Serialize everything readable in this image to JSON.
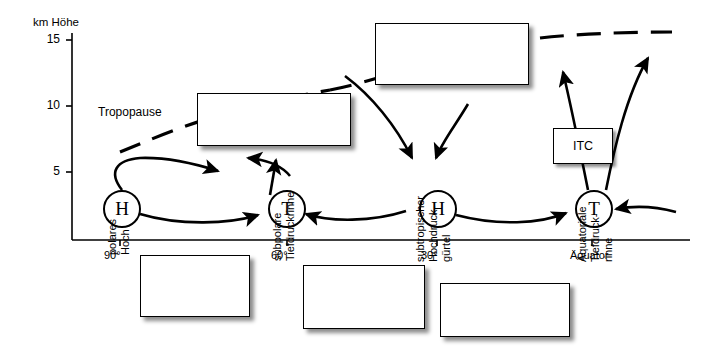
{
  "axis": {
    "y_title": "km Höhe",
    "y_ticks": [
      "15",
      "10",
      "5"
    ],
    "x_ticks": [
      "90°",
      "60°",
      "30°",
      "Äquator"
    ]
  },
  "labels": {
    "tropopause": "Tropopause",
    "itc": "ITC"
  },
  "ground_labels": [
    {
      "line1": "polares",
      "line2": "Hoch"
    },
    {
      "line1": "subpolare",
      "line2": "Tiefdruckrinne"
    },
    {
      "line1": "subtropischer",
      "line2": "Hochdruck-",
      "line3": "gürtel"
    },
    {
      "line1": "Äquatoriale",
      "line2": "Tiefdruck-",
      "line3": "rinne"
    }
  ],
  "pressure_cells": [
    {
      "symbol": "H"
    },
    {
      "symbol": "T"
    },
    {
      "symbol": "H"
    },
    {
      "symbol": "T"
    }
  ],
  "callout_boxes": [
    {
      "id": "box-upper-left"
    },
    {
      "id": "box-upper-right"
    },
    {
      "id": "box-ground-1"
    },
    {
      "id": "box-ground-2"
    },
    {
      "id": "box-ground-3"
    }
  ],
  "colors": {
    "stroke": "#000000",
    "background": "#ffffff",
    "shadow": "rgba(0,0,0,0.45)"
  }
}
